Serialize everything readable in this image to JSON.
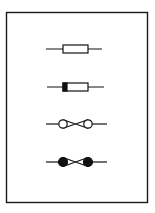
{
  "diagram": {
    "type": "electrical-symbol-sheet",
    "frame": {
      "x": 6.5,
      "y": 12.5,
      "width": 141,
      "height": 190,
      "stroke": "#1a1a1a"
    },
    "ink_color": "#111111",
    "background": "#ffffff",
    "symbols": [
      {
        "id": "fuse",
        "name": "Fuse (general)",
        "y": 49,
        "lead": [
          46,
          102
        ],
        "body": {
          "x": 63,
          "width": 25,
          "height": 8
        },
        "marked_end": false
      },
      {
        "id": "fuse-supply-side",
        "name": "Fuse (supply side marked)",
        "y": 87,
        "lead": [
          47,
          104
        ],
        "body": {
          "x": 63,
          "width": 25,
          "height": 8
        },
        "marked_end": true,
        "mark_width": 4
      },
      {
        "id": "fusible-link-open",
        "name": "Fusible link (open terminals)",
        "y": 124,
        "lead": [
          46,
          107
        ],
        "circles": [
          63,
          88
        ],
        "radius": 4.2,
        "filled": false
      },
      {
        "id": "fusible-link-filled",
        "name": "Fusible link (filled terminals)",
        "y": 162,
        "lead": [
          46,
          107
        ],
        "circles": [
          63,
          88
        ],
        "radius": 4.5,
        "filled": true
      }
    ]
  }
}
